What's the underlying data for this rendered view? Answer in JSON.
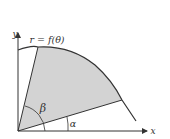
{
  "diagram": {
    "curve_label": "r = f(θ)",
    "axis_labels": {
      "x": "x",
      "y": "y"
    },
    "angle_labels": {
      "alpha": "α",
      "beta": "β"
    },
    "colors": {
      "stroke": "#333333",
      "shaded_region": "#d3d3d3",
      "background": "#ffffff"
    }
  }
}
